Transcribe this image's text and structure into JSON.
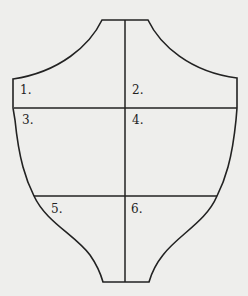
{
  "diagram": {
    "stroke_color": "#222222",
    "background": "#eeeeec",
    "regions": [
      {
        "id": 1,
        "label": "1."
      },
      {
        "id": 2,
        "label": "2."
      },
      {
        "id": 3,
        "label": "3."
      },
      {
        "id": 4,
        "label": "4."
      },
      {
        "id": 5,
        "label": "5."
      },
      {
        "id": 6,
        "label": "6."
      }
    ]
  }
}
